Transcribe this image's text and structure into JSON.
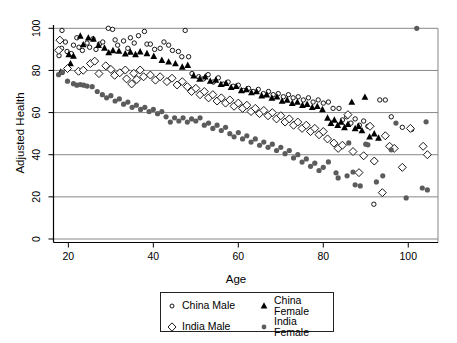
{
  "chart_data": {
    "type": "scatter",
    "title": "",
    "xlabel": "Age",
    "ylabel": "Adjusted Health",
    "xlim": [
      16.5,
      107
    ],
    "ylim": [
      0,
      100
    ],
    "xticks": [
      20,
      40,
      60,
      80,
      100
    ],
    "yticks": [
      0,
      20,
      40,
      60,
      80,
      100
    ],
    "grid": "horizontal",
    "legend_position": "below-chart-boxed",
    "colors": {
      "background": "#ffffff",
      "gridline": "#878787",
      "axis": "#000000",
      "black_marker": "#000000",
      "gray_marker": "#5c5c5c",
      "legend_border": "#222222"
    },
    "series": [
      {
        "name": "China Male",
        "marker": "open-circle",
        "color": "#000000",
        "points": [
          [
            17.8,
            87
          ],
          [
            18.4,
            90.5
          ],
          [
            18.5,
            99
          ],
          [
            19.3,
            93.5
          ],
          [
            19.7,
            89
          ],
          [
            20.7,
            88
          ],
          [
            21.2,
            92
          ],
          [
            22,
            95.5
          ],
          [
            22.5,
            91
          ],
          [
            23.3,
            89.5
          ],
          [
            24.4,
            93
          ],
          [
            25,
            91
          ],
          [
            25.8,
            95
          ],
          [
            26.5,
            90
          ],
          [
            27.3,
            92.5
          ],
          [
            28.1,
            93.5
          ],
          [
            29.4,
            100
          ],
          [
            30.4,
            99.5
          ],
          [
            31,
            94.5
          ],
          [
            31.6,
            92
          ],
          [
            33,
            94
          ],
          [
            34,
            90.5
          ],
          [
            34.6,
            95.5
          ],
          [
            35.5,
            93
          ],
          [
            36.5,
            96.5
          ],
          [
            37.9,
            98.5
          ],
          [
            38.5,
            92.5
          ],
          [
            39.3,
            92.5
          ],
          [
            40.3,
            90
          ],
          [
            41.6,
            90.5
          ],
          [
            42.5,
            93.5
          ],
          [
            43.6,
            92
          ],
          [
            44.5,
            89.5
          ],
          [
            45.9,
            89
          ],
          [
            46.7,
            86.5
          ],
          [
            47.5,
            99
          ],
          [
            48.3,
            86.5
          ],
          [
            49.1,
            78.5
          ],
          [
            50.7,
            77
          ],
          [
            51.8,
            76
          ],
          [
            52.9,
            78
          ],
          [
            54.1,
            74.5
          ],
          [
            55.3,
            76.5
          ],
          [
            56.5,
            73.5
          ],
          [
            57.6,
            74.5
          ],
          [
            58.8,
            72.5
          ],
          [
            60,
            73
          ],
          [
            61.2,
            70.5
          ],
          [
            62.4,
            71.5
          ],
          [
            63.5,
            70
          ],
          [
            64.7,
            71
          ],
          [
            65.9,
            69
          ],
          [
            67.1,
            70
          ],
          [
            68.2,
            68.5
          ],
          [
            69.4,
            69
          ],
          [
            70.6,
            67.5
          ],
          [
            71.8,
            68.5
          ],
          [
            72.9,
            67
          ],
          [
            74.1,
            67.5
          ],
          [
            75.3,
            66
          ],
          [
            76.5,
            67
          ],
          [
            77.6,
            65
          ],
          [
            78.8,
            66
          ],
          [
            80,
            64.5
          ],
          [
            81.2,
            65
          ],
          [
            82.3,
            62
          ],
          [
            83.7,
            62
          ],
          [
            84.5,
            56.5
          ],
          [
            85.5,
            58
          ],
          [
            86.5,
            55
          ],
          [
            87.5,
            57
          ],
          [
            88.5,
            54
          ],
          [
            89.5,
            56
          ],
          [
            90.5,
            53.5
          ],
          [
            91.9,
            16.5
          ],
          [
            93.3,
            66
          ],
          [
            94.6,
            66
          ],
          [
            96,
            58
          ],
          [
            98.6,
            53
          ],
          [
            100.8,
            52
          ]
        ]
      },
      {
        "name": "China Female",
        "marker": "filled-triangle",
        "color": "#000000",
        "points": [
          [
            18.2,
            79.3
          ],
          [
            20.1,
            87.6
          ],
          [
            20.5,
            83.3
          ],
          [
            21.2,
            86.9
          ],
          [
            22.8,
            96.4
          ],
          [
            23.5,
            92.3
          ],
          [
            24.7,
            95.5
          ],
          [
            25.9,
            94.9
          ],
          [
            27.1,
            92
          ],
          [
            28.5,
            90.7
          ],
          [
            29.5,
            88.5
          ],
          [
            30.5,
            89.5
          ],
          [
            31.9,
            89.2
          ],
          [
            33.4,
            88
          ],
          [
            34.6,
            88.8
          ],
          [
            35.8,
            87.6
          ],
          [
            36.9,
            88.9
          ],
          [
            38.5,
            88.1
          ],
          [
            40.1,
            86.8
          ],
          [
            42,
            84.9
          ],
          [
            43.6,
            84.1
          ],
          [
            45.2,
            83.3
          ],
          [
            46.8,
            81.7
          ],
          [
            48.1,
            82.5
          ],
          [
            49.5,
            77.5
          ],
          [
            50.9,
            76
          ],
          [
            52.2,
            77
          ],
          [
            53.4,
            75
          ],
          [
            54.7,
            75.5
          ],
          [
            55.9,
            73.5
          ],
          [
            57.1,
            74
          ],
          [
            58.3,
            72
          ],
          [
            59.5,
            72.5
          ],
          [
            60.7,
            70.5
          ],
          [
            61.9,
            71
          ],
          [
            63.1,
            69.5
          ],
          [
            64.3,
            70
          ],
          [
            65.5,
            68
          ],
          [
            66.7,
            68.5
          ],
          [
            67.9,
            67
          ],
          [
            69.1,
            67.5
          ],
          [
            70.3,
            65.5
          ],
          [
            71.5,
            66
          ],
          [
            72.7,
            64.5
          ],
          [
            73.9,
            65
          ],
          [
            75.1,
            63.5
          ],
          [
            76.2,
            64
          ],
          [
            77.4,
            62.5
          ],
          [
            78.6,
            63
          ],
          [
            79.8,
            61.5
          ],
          [
            81,
            57.5
          ],
          [
            81.8,
            55
          ],
          [
            82.6,
            56.5
          ],
          [
            83.4,
            54
          ],
          [
            84.2,
            55.5
          ],
          [
            85,
            53
          ],
          [
            85.8,
            54.5
          ],
          [
            86.7,
            65
          ],
          [
            87.5,
            52.5
          ],
          [
            88.3,
            53.5
          ],
          [
            89.1,
            51.5
          ],
          [
            89.8,
            67.4
          ],
          [
            90.9,
            48.5
          ],
          [
            92,
            50
          ],
          [
            93,
            48
          ]
        ]
      },
      {
        "name": "India Male",
        "marker": "open-diamond",
        "color": "#000000",
        "points": [
          [
            17.7,
            89.6
          ],
          [
            18,
            94.4
          ],
          [
            19.8,
            80.9
          ],
          [
            22.4,
            79.6
          ],
          [
            23.5,
            80.1
          ],
          [
            25.2,
            83.3
          ],
          [
            26.2,
            84.4
          ],
          [
            27.2,
            78.5
          ],
          [
            28.8,
            82.2
          ],
          [
            30,
            80.5
          ],
          [
            30.9,
            77.7
          ],
          [
            32.1,
            78.9
          ],
          [
            33.4,
            80.2
          ],
          [
            33.7,
            76
          ],
          [
            34.9,
            73.6
          ],
          [
            35.4,
            78.6
          ],
          [
            36.1,
            75.7
          ],
          [
            36.9,
            80.2
          ],
          [
            37.7,
            77
          ],
          [
            39.3,
            77.8
          ],
          [
            40.5,
            75.4
          ],
          [
            41.6,
            77
          ],
          [
            43.2,
            74.7
          ],
          [
            44.4,
            76.3
          ],
          [
            45.6,
            73.1
          ],
          [
            46.8,
            74.7
          ],
          [
            48,
            72.3
          ],
          [
            49,
            70
          ],
          [
            50,
            71.5
          ],
          [
            51,
            68.5
          ],
          [
            52,
            70
          ],
          [
            53,
            67
          ],
          [
            54,
            68.5
          ],
          [
            55,
            65.5
          ],
          [
            56,
            67
          ],
          [
            57,
            64.5
          ],
          [
            58,
            66
          ],
          [
            59,
            63
          ],
          [
            60,
            64.5
          ],
          [
            61,
            62
          ],
          [
            62,
            63.5
          ],
          [
            63,
            60.5
          ],
          [
            64,
            62
          ],
          [
            65,
            59.5
          ],
          [
            66,
            61
          ],
          [
            67,
            58.5
          ],
          [
            68,
            60
          ],
          [
            69,
            57
          ],
          [
            70,
            58.5
          ],
          [
            71,
            55.5
          ],
          [
            72,
            57
          ],
          [
            73,
            54
          ],
          [
            74,
            55.5
          ],
          [
            75,
            52.5
          ],
          [
            76,
            54
          ],
          [
            77,
            51
          ],
          [
            78,
            52.5
          ],
          [
            79,
            49.5
          ],
          [
            80,
            51
          ],
          [
            81,
            47.5
          ],
          [
            82.5,
            45.5
          ],
          [
            83.5,
            43
          ],
          [
            84.5,
            44.5
          ],
          [
            85.8,
            59
          ],
          [
            87,
            41.5
          ],
          [
            88.4,
            31.5
          ],
          [
            89.5,
            39.5
          ],
          [
            91,
            53.5
          ],
          [
            92,
            37
          ],
          [
            93.9,
            22
          ],
          [
            94.6,
            49
          ],
          [
            95.6,
            44
          ],
          [
            96.7,
            43
          ],
          [
            98.6,
            34
          ],
          [
            100.5,
            52.5
          ],
          [
            103.5,
            44
          ],
          [
            104.5,
            40
          ]
        ]
      },
      {
        "name": "India Female",
        "marker": "filled-circle",
        "color": "#5c5c5c",
        "points": [
          [
            17.7,
            78
          ],
          [
            18.6,
            79.2
          ],
          [
            19.8,
            74.9
          ],
          [
            21.2,
            73.7
          ],
          [
            22,
            73
          ],
          [
            22.8,
            73.3
          ],
          [
            23.6,
            73
          ],
          [
            24.4,
            72.6
          ],
          [
            25.6,
            72.3
          ],
          [
            26.8,
            70
          ],
          [
            28,
            68.5
          ],
          [
            29,
            67
          ],
          [
            30,
            68
          ],
          [
            31,
            65.5
          ],
          [
            32,
            66.5
          ],
          [
            33,
            64
          ],
          [
            34,
            65
          ],
          [
            35,
            62.5
          ],
          [
            36,
            63.5
          ],
          [
            37,
            61.5
          ],
          [
            38,
            62.5
          ],
          [
            39,
            60.5
          ],
          [
            40,
            61.5
          ],
          [
            41,
            59.5
          ],
          [
            42,
            60.5
          ],
          [
            43,
            58
          ],
          [
            44,
            55.5
          ],
          [
            45,
            57.5
          ],
          [
            46,
            56
          ],
          [
            47,
            57.5
          ],
          [
            48,
            55.5
          ],
          [
            49,
            57
          ],
          [
            50,
            56
          ],
          [
            51,
            57.5
          ],
          [
            52,
            54
          ],
          [
            53,
            55
          ],
          [
            54,
            52.5
          ],
          [
            55,
            54
          ],
          [
            56,
            51.5
          ],
          [
            57,
            53
          ],
          [
            58,
            50
          ],
          [
            59,
            48.5
          ],
          [
            60,
            50.5
          ],
          [
            61,
            47.5
          ],
          [
            62,
            49
          ],
          [
            63,
            46
          ],
          [
            64,
            47.5
          ],
          [
            65,
            44.5
          ],
          [
            66,
            46
          ],
          [
            67,
            43.5
          ],
          [
            68,
            45
          ],
          [
            69,
            42
          ],
          [
            70,
            43.5
          ],
          [
            71,
            40.5
          ],
          [
            72,
            42
          ],
          [
            73,
            38.5
          ],
          [
            74,
            40
          ],
          [
            75,
            36.5
          ],
          [
            76,
            38
          ],
          [
            77,
            34.5
          ],
          [
            78,
            36
          ],
          [
            79,
            32.5
          ],
          [
            80,
            34
          ],
          [
            81.2,
            36.6
          ],
          [
            83,
            31.4
          ],
          [
            83.5,
            29
          ],
          [
            85.6,
            30
          ],
          [
            86,
            45.6
          ],
          [
            87,
            31.8
          ],
          [
            87.5,
            25.7
          ],
          [
            88.7,
            25.2
          ],
          [
            90,
            45
          ],
          [
            90.5,
            44.7
          ],
          [
            92.5,
            27.1
          ],
          [
            94,
            30
          ],
          [
            96,
            42.3
          ],
          [
            97.1,
            55
          ],
          [
            99.5,
            19.5
          ],
          [
            102,
            100
          ],
          [
            103.3,
            24.2
          ],
          [
            104.2,
            55.6
          ],
          [
            104.5,
            23.3
          ]
        ]
      }
    ]
  }
}
